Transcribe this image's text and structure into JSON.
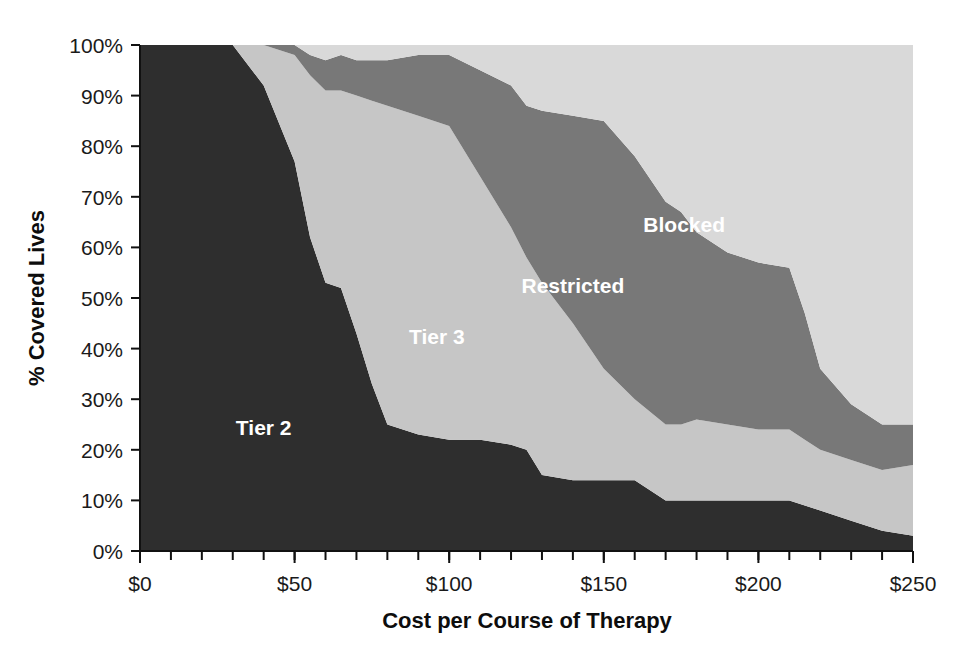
{
  "chart_data": {
    "type": "area",
    "title": "",
    "subtitle": "",
    "xlabel": "Cost per Course of Therapy",
    "ylabel": "% Covered Lives",
    "stacked": true,
    "stack_total": 100,
    "grid": false,
    "legend_position": "inline-labels",
    "xlim": [
      0,
      250
    ],
    "ylim": [
      0,
      100
    ],
    "xtick_labels": [
      "$0",
      "$50",
      "$100",
      "$150",
      "$200",
      "$250"
    ],
    "xtick_values": [
      0,
      50,
      100,
      150,
      200,
      250
    ],
    "xtick_minor_step": 10,
    "ytick_labels": [
      "0%",
      "10%",
      "20%",
      "30%",
      "40%",
      "50%",
      "60%",
      "70%",
      "80%",
      "90%",
      "100%"
    ],
    "ytick_values": [
      0,
      10,
      20,
      30,
      40,
      50,
      60,
      70,
      80,
      90,
      100
    ],
    "x": [
      0,
      10,
      20,
      30,
      40,
      50,
      55,
      60,
      65,
      70,
      75,
      80,
      90,
      100,
      110,
      120,
      125,
      130,
      140,
      150,
      160,
      170,
      175,
      180,
      190,
      200,
      210,
      215,
      220,
      230,
      240,
      250
    ],
    "series": [
      {
        "name": "Tier 2",
        "color": "#2e2e2e",
        "label_color": "#ffffff",
        "label_x": 40,
        "label_y": 23,
        "values": [
          100,
          100,
          100,
          100,
          92,
          77,
          62,
          53,
          52,
          43,
          33,
          25,
          23,
          22,
          22,
          21,
          20,
          15,
          14,
          14,
          14,
          10,
          10,
          10,
          10,
          10,
          10,
          9,
          8,
          6,
          4,
          3
        ]
      },
      {
        "name": "Tier 3",
        "color": "#c6c6c6",
        "label_color": "#ffffff",
        "label_x": 96,
        "label_y": 41,
        "values": [
          0,
          0,
          0,
          0,
          8,
          21,
          32,
          38,
          39,
          47,
          56,
          63,
          63,
          62,
          52,
          43,
          38,
          38,
          31,
          22,
          16,
          15,
          15,
          16,
          15,
          14,
          14,
          13,
          12,
          12,
          12,
          14
        ]
      },
      {
        "name": "Restricted",
        "color": "#787878",
        "label_color": "#ffffff",
        "label_x": 140,
        "label_y": 51,
        "values": [
          0,
          0,
          0,
          0,
          0,
          2,
          4,
          6,
          7,
          7,
          8,
          9,
          12,
          14,
          21,
          28,
          30,
          34,
          41,
          49,
          48,
          44,
          42,
          37,
          34,
          33,
          32,
          25,
          16,
          11,
          9,
          8
        ]
      },
      {
        "name": "Blocked",
        "color": "#d9d9d9",
        "label_color": "#ffffff",
        "label_x": 176,
        "label_y": 63,
        "values": [
          0,
          0,
          0,
          0,
          0,
          0,
          2,
          3,
          2,
          3,
          3,
          3,
          2,
          2,
          5,
          8,
          12,
          13,
          14,
          15,
          22,
          31,
          33,
          37,
          41,
          43,
          44,
          53,
          64,
          71,
          75,
          75
        ]
      }
    ]
  },
  "axes": {
    "y_title": "% Covered Lives",
    "x_title": "Cost per Course of Therapy"
  },
  "colors": {
    "tier2": "#2e2e2e",
    "tier3": "#c6c6c6",
    "restricted": "#787878",
    "blocked": "#d9d9d9",
    "axis": "#111111",
    "text": "#1a1a1a",
    "background": "#ffffff"
  }
}
